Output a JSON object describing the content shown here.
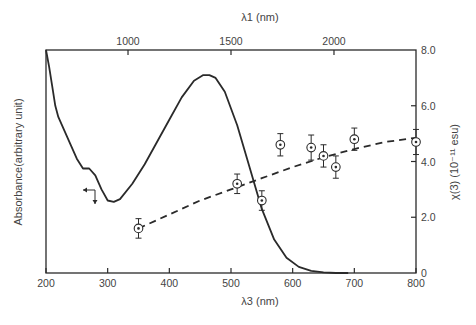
{
  "chart_data": {
    "type": "line",
    "title": "",
    "top_axis": {
      "label": "λ1  (nm)",
      "ticks": [
        {
          "value": 1000,
          "label": "1000"
        },
        {
          "value": 1500,
          "label": "1500"
        },
        {
          "value": 2000,
          "label": "2000"
        }
      ],
      "tick_positions_lambda3": [
        333,
        500,
        667
      ]
    },
    "bottom_axis": {
      "label": "λ3  (nm)",
      "xlim": [
        200,
        800
      ],
      "ticks": [
        200,
        300,
        400,
        500,
        600,
        700,
        800
      ]
    },
    "left_axis": {
      "label": "Absorbance(arbitrary unit)",
      "arrow": "→",
      "ticks": []
    },
    "right_axis": {
      "label": "χ(3)  (10⁻¹¹ esu)",
      "ylim": [
        0,
        8.0
      ],
      "ticks": [
        {
          "value": 0,
          "label": "0"
        },
        {
          "value": 2.0,
          "label": "2.0"
        },
        {
          "value": 4.0,
          "label": "4.0"
        },
        {
          "value": 6.0,
          "label": "6.0"
        },
        {
          "value": 8.0,
          "label": "8.0"
        }
      ]
    },
    "series": [
      {
        "name": "Absorbance",
        "axis": "left",
        "style": "solid",
        "x": [
          200,
          205,
          210,
          215,
          220,
          230,
          240,
          250,
          260,
          270,
          280,
          290,
          300,
          310,
          320,
          340,
          360,
          380,
          400,
          420,
          440,
          455,
          465,
          475,
          490,
          510,
          530,
          550,
          570,
          590,
          610,
          630,
          650,
          670,
          690
        ],
        "y": [
          8.0,
          7.4,
          6.7,
          6.0,
          5.6,
          5.1,
          4.6,
          4.1,
          3.75,
          3.75,
          3.5,
          3.0,
          2.6,
          2.55,
          2.65,
          3.2,
          3.9,
          4.7,
          5.5,
          6.3,
          6.9,
          7.1,
          7.1,
          7.0,
          6.5,
          5.3,
          3.8,
          2.3,
          1.2,
          0.55,
          0.22,
          0.08,
          0.02,
          0.0,
          0.0
        ]
      },
      {
        "name": "χ(3)",
        "axis": "right",
        "style": "markers-with-error-bars",
        "x": [
          350,
          510,
          550,
          580,
          630,
          650,
          670,
          700,
          800
        ],
        "y": [
          1.6,
          3.2,
          2.6,
          4.6,
          4.5,
          4.2,
          3.8,
          4.8,
          4.7
        ],
        "error": [
          0.35,
          0.35,
          0.35,
          0.4,
          0.45,
          0.4,
          0.4,
          0.4,
          0.45
        ]
      },
      {
        "name": "χ(3) trend",
        "axis": "right",
        "style": "dashed",
        "x": [
          350,
          400,
          450,
          500,
          550,
          600,
          650,
          700,
          750,
          800
        ],
        "y": [
          1.6,
          2.1,
          2.6,
          3.0,
          3.4,
          3.8,
          4.15,
          4.45,
          4.7,
          4.85
        ]
      }
    ],
    "annotations": [
      {
        "type": "arrow-indicator",
        "text": "left arrow points to left axis for absorbance curve",
        "x": 280,
        "y": 2.6
      }
    ],
    "grid": false,
    "legend": null
  }
}
